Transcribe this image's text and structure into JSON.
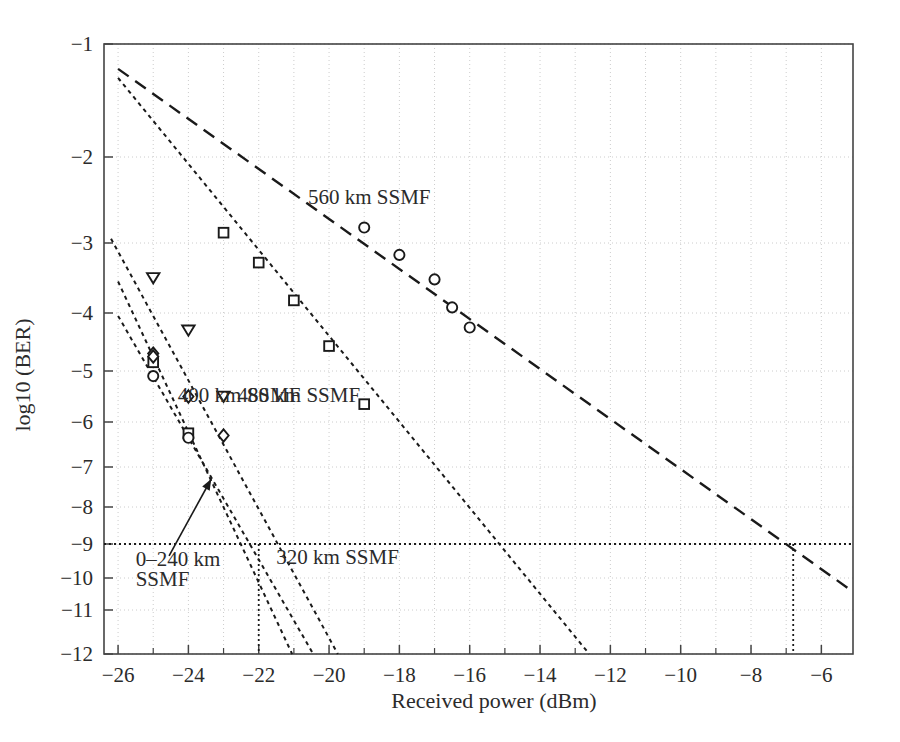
{
  "chart_data": {
    "type": "line",
    "title": "",
    "xlabel": "Received power (dBm)",
    "ylabel": "log10 (BER)",
    "xlim": [
      -26.4,
      -5.1
    ],
    "ylim": [
      -12,
      -1
    ],
    "grid": true,
    "legend_position": "inline-annotations",
    "x_ticks_major": [
      -26,
      -24,
      -22,
      -20,
      -18,
      -16,
      -14,
      -12,
      -10,
      -8,
      -6
    ],
    "x_tick_labels": [
      "−26",
      "−24",
      "−22",
      "−20",
      "−18",
      "−16",
      "−14",
      "−12",
      "−10",
      "−8",
      "−6"
    ],
    "x_ticks_minor": [
      -25,
      -23,
      -21,
      -19,
      -17,
      -15,
      -13,
      -11,
      -9,
      -7
    ],
    "y_ticks": [
      -1,
      -2,
      -3,
      -4,
      -5,
      -6,
      -7,
      -8,
      -9,
      -10,
      -11,
      -12
    ],
    "y_tick_labels": [
      "−1",
      "−2",
      "−3",
      "−4",
      "−5",
      "−6",
      "−7",
      "−8",
      "−9",
      "−10",
      "−11",
      "−12"
    ],
    "y_axis_note": "Q-scale (BER) axis: spacing compresses toward lower log10(BER)",
    "reference_lines": [
      {
        "name": "ber-1e-9-horizontal",
        "orientation": "horizontal",
        "y": -9,
        "style": "dotted"
      },
      {
        "name": "sensitivity-0-240km-vertical",
        "orientation": "vertical",
        "x": -22.0,
        "y_from": -9,
        "y_to": -12,
        "style": "dotted"
      },
      {
        "name": "sensitivity-560km-vertical",
        "orientation": "vertical",
        "x": -6.8,
        "y_from": -9,
        "y_to": -12,
        "style": "dotted"
      }
    ],
    "annotations": [
      {
        "name": "label-560km",
        "text": "560 km SSMF",
        "x": -20.6,
        "y": -2.55
      },
      {
        "name": "label-480km",
        "text": "480 km SSMF",
        "x": -22.6,
        "y": -5.6
      },
      {
        "name": "label-400km",
        "text": "400 km SSMF",
        "x": -24.3,
        "y": -5.6
      },
      {
        "name": "label-320km",
        "text": "320 km SSMF",
        "x": -21.5,
        "y": -9.6
      },
      {
        "name": "label-0-240km-line1",
        "text": "0–240 km",
        "x": -25.5,
        "y": -9.65
      },
      {
        "name": "label-0-240km-line2",
        "text": "SSMF",
        "x": -25.5,
        "y": -10.25
      },
      {
        "name": "arrow-0-240km",
        "text": "",
        "from_x": -24.55,
        "from_y": -9.35,
        "to_x": -23.35,
        "to_y": -7.3
      }
    ],
    "series": [
      {
        "name": "0–240 km SSMF",
        "marker": "mixed (diamond / square / circle overlapped)",
        "line_style": "dotted",
        "sensitivity_at_1e-9_dBm": -22.0,
        "points": [
          {
            "x": -25.0,
            "y": -4.7
          },
          {
            "x": -25.0,
            "y": -4.85
          },
          {
            "x": -25.0,
            "y": -5.1
          },
          {
            "x": -24.0,
            "y": -6.25
          },
          {
            "x": -24.0,
            "y": -6.35
          }
        ],
        "fit_endpoints": [
          {
            "x": -26.0,
            "y": -3.55
          },
          {
            "x": -21.05,
            "y": -12
          }
        ]
      },
      {
        "name": "320 km SSMF",
        "marker": "diamond",
        "line_style": "dotted",
        "sensitivity_at_1e-9_dBm": -21.3,
        "points": [
          {
            "x": -25.0,
            "y": -4.75
          },
          {
            "x": -24.0,
            "y": -5.5
          },
          {
            "x": -23.0,
            "y": -6.3
          }
        ],
        "fit_endpoints": [
          {
            "x": -26.0,
            "y": -4.05
          },
          {
            "x": -20.45,
            "y": -12
          }
        ]
      },
      {
        "name": "400 km SSMF",
        "marker": "triangle-down",
        "line_style": "dotted",
        "sensitivity_at_1e-9_dBm": -20.7,
        "points": [
          {
            "x": -25.0,
            "y": -3.5
          },
          {
            "x": -24.0,
            "y": -4.3
          },
          {
            "x": -23.0,
            "y": -5.5
          }
        ],
        "fit_endpoints": [
          {
            "x": -26.2,
            "y": -2.95
          },
          {
            "x": -19.75,
            "y": -12
          }
        ]
      },
      {
        "name": "480 km SSMF",
        "marker": "square",
        "line_style": "dotted",
        "sensitivity_at_1e-9_dBm": -17.5,
        "points": [
          {
            "x": -23.0,
            "y": -2.88
          },
          {
            "x": -22.0,
            "y": -3.28
          },
          {
            "x": -21.0,
            "y": -3.82
          },
          {
            "x": -20.0,
            "y": -4.57
          },
          {
            "x": -19.0,
            "y": -5.65
          }
        ],
        "fit_endpoints": [
          {
            "x": -26.0,
            "y": -1.3
          },
          {
            "x": -12.6,
            "y": -12
          }
        ]
      },
      {
        "name": "560 km SSMF",
        "marker": "circle",
        "line_style": "dashed",
        "sensitivity_at_1e-9_dBm": -6.8,
        "points": [
          {
            "x": -19.0,
            "y": -2.82
          },
          {
            "x": -18.0,
            "y": -3.17
          },
          {
            "x": -17.0,
            "y": -3.52
          },
          {
            "x": -16.5,
            "y": -3.92
          },
          {
            "x": -16.0,
            "y": -4.25
          }
        ],
        "fit_endpoints": [
          {
            "x": -26.0,
            "y": -1.22
          },
          {
            "x": -5.2,
            "y": -10.35
          }
        ]
      }
    ]
  },
  "figure": {
    "background_color": "#ffffff",
    "axis_color": "#444444",
    "grid_color": "#cccccc",
    "line_color": "#1a1a1a"
  }
}
